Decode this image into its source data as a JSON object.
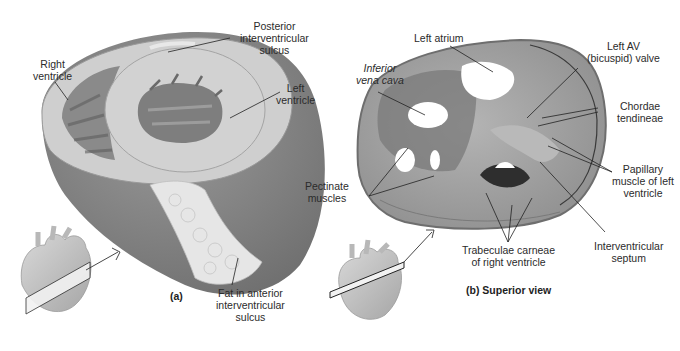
{
  "panel_a": {
    "caption": "(a)",
    "labels": {
      "posterior_sulcus": [
        "Posterior",
        "interventricular",
        "sulcus"
      ],
      "right_ventricle": [
        "Right",
        "ventricle"
      ],
      "left_ventricle": [
        "Left",
        "ventricle"
      ],
      "fat_anterior_sulcus": [
        "Fat in anterior",
        "interventricular",
        "sulcus"
      ]
    }
  },
  "panel_b": {
    "caption": "(b) Superior view",
    "labels": {
      "left_atrium": [
        "Left atrium"
      ],
      "inferior_vena_cava": [
        "Inferior",
        "vena cava"
      ],
      "left_av_valve": [
        "Left AV",
        "(bicuspid) valve"
      ],
      "chordae_tendineae": [
        "Chordae",
        "tendineae"
      ],
      "pectinate_muscles": [
        "Pectinate",
        "muscles"
      ],
      "papillary_muscle": [
        "Papillary",
        "muscle of left",
        "ventricle"
      ],
      "trabeculae_carneae": [
        "Trabeculae carneae",
        "of right ventricle"
      ],
      "interventricular_septum": [
        "Interventricular",
        "septum"
      ]
    }
  },
  "colors": {
    "background": "#ffffff",
    "myocardium_light": "#c9c9c9",
    "myocardium_dark": "#7e7e7e",
    "fat": "#e4e4e4",
    "specimen": "#a8a8a8",
    "leader_line": "#222222"
  }
}
